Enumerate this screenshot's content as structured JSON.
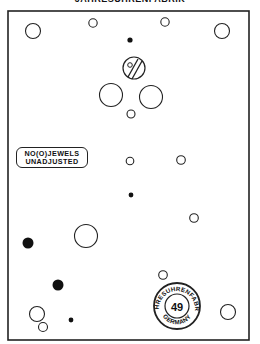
{
  "title": "JAHRESUHRENFABRIK",
  "label": {
    "line1": "NO(O)JEWELS",
    "line2": "UNADJUSTED"
  },
  "stamp": {
    "top_text": "JAHRESUHRENFABRIK",
    "center_number": "49",
    "bottom_text": "GERMANY"
  },
  "colors": {
    "ink": "#222222",
    "background": "#ffffff"
  }
}
